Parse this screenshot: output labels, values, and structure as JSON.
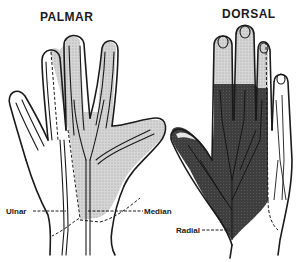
{
  "figure": {
    "panels": [
      {
        "id": "palmar",
        "title": "PALMAR"
      },
      {
        "id": "dorsal",
        "title": "DORSAL"
      }
    ],
    "labels": {
      "ulnar": "Ulnar",
      "median": "Median",
      "radial": "Radial"
    },
    "colors": {
      "median_area": "#cfcfcf",
      "radial_area": "#3a3a3a",
      "dorsal_light_area": "#d4d4d4",
      "outline": "#1a1a1a"
    }
  }
}
